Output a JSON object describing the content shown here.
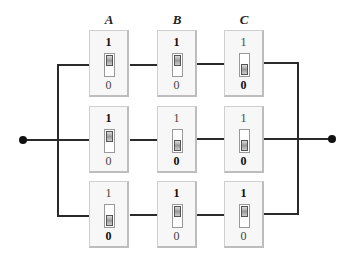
{
  "diagram": {
    "type": "switch-circuit",
    "columns": [
      "A",
      "B",
      "C"
    ],
    "rows": [
      {
        "switches": [
          {
            "column": "A",
            "state": 1
          },
          {
            "column": "B",
            "state": 1
          },
          {
            "column": "C",
            "state": 0
          }
        ]
      },
      {
        "switches": [
          {
            "column": "A",
            "state": 1
          },
          {
            "column": "B",
            "state": 0
          },
          {
            "column": "C",
            "state": 0
          }
        ]
      },
      {
        "switches": [
          {
            "column": "A",
            "state": 0
          },
          {
            "column": "B",
            "state": 1
          },
          {
            "column": "C",
            "state": 1
          }
        ]
      }
    ],
    "labels": {
      "on": "1",
      "off": "0"
    },
    "terminals": [
      "left-terminal",
      "right-terminal"
    ],
    "wire_color": "#2a2a2a"
  }
}
